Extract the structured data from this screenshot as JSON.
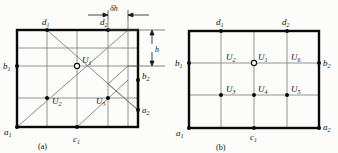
{
  "figure": {
    "caption_a": "(a)",
    "caption_b": "(b)"
  },
  "dimensions": {
    "delta_h": "δh",
    "h": "h"
  },
  "panel_a": {
    "boundary_labels": [
      {
        "id": "d1",
        "base": "d",
        "sub": "1"
      },
      {
        "id": "d2",
        "base": "d",
        "sub": "2"
      },
      {
        "id": "b1",
        "base": "b",
        "sub": "1"
      },
      {
        "id": "b2",
        "base": "b",
        "sub": "2"
      },
      {
        "id": "a1",
        "base": "a",
        "sub": "1"
      },
      {
        "id": "a2",
        "base": "a",
        "sub": "2"
      },
      {
        "id": "c1",
        "base": "c",
        "sub": "1"
      }
    ],
    "node_labels": [
      {
        "id": "U1",
        "base": "U",
        "sub": "1"
      },
      {
        "id": "U2",
        "base": "U",
        "sub": "2"
      },
      {
        "id": "U5",
        "base": "U",
        "sub": "5"
      }
    ]
  },
  "panel_b": {
    "boundary_labels": [
      {
        "id": "d1",
        "base": "d",
        "sub": "1"
      },
      {
        "id": "d2",
        "base": "d",
        "sub": "2"
      },
      {
        "id": "b1",
        "base": "b",
        "sub": "1"
      },
      {
        "id": "b2",
        "base": "b",
        "sub": "2"
      },
      {
        "id": "a1",
        "base": "a",
        "sub": "1"
      },
      {
        "id": "a2",
        "base": "a",
        "sub": "2"
      },
      {
        "id": "c1",
        "base": "c",
        "sub": "1"
      }
    ],
    "node_labels": [
      {
        "id": "U1",
        "base": "U",
        "sub": "1"
      },
      {
        "id": "U2",
        "base": "U",
        "sub": "2"
      },
      {
        "id": "U3",
        "base": "U",
        "sub": "3"
      },
      {
        "id": "U4",
        "base": "U",
        "sub": "4"
      },
      {
        "id": "U5",
        "base": "U",
        "sub": "5"
      },
      {
        "id": "U6",
        "base": "U",
        "sub": "6"
      }
    ]
  },
  "colors": {
    "frame": "#0a0a0a",
    "grid": "#7a7a7a",
    "diagonal": "#6e6e6e",
    "node": "#0a0a0a",
    "background": "#fcfcfa"
  }
}
